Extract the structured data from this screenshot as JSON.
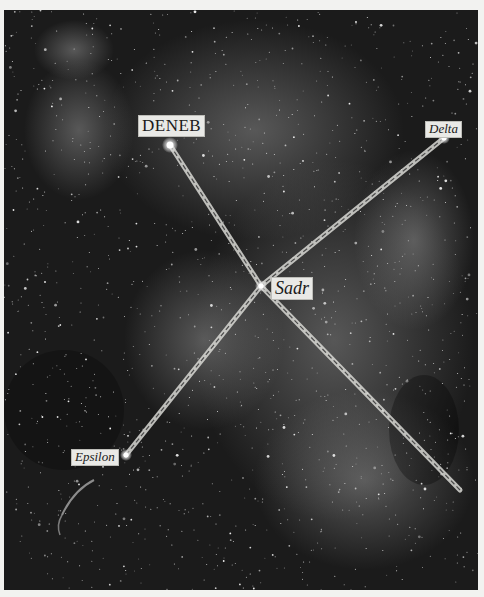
{
  "photo": {
    "subject": "Star field with asterism overlay (Northern Cross)",
    "colors": {
      "background": "#1b1b1b",
      "page": "#f2f2f0",
      "line": "#d8d8d4",
      "line_dash": "#4a4a4a",
      "label_bg": "#e9e9e6",
      "label_text": "#1a1a1a"
    }
  },
  "stars": [
    {
      "id": "deneb",
      "label": "DENEB",
      "x": 166,
      "y": 135,
      "style": "caps"
    },
    {
      "id": "delta",
      "label": "Delta",
      "x": 440,
      "y": 128,
      "style": "italic"
    },
    {
      "id": "sadr",
      "label": "Sadr",
      "x": 257,
      "y": 276,
      "style": "italic"
    },
    {
      "id": "epsilon",
      "label": "Epsilon",
      "x": 122,
      "y": 445,
      "style": "italic"
    }
  ],
  "lines": [
    {
      "from": [
        166,
        135
      ],
      "to": [
        257,
        276
      ]
    },
    {
      "from": [
        440,
        128
      ],
      "to": [
        257,
        276
      ]
    },
    {
      "from": [
        122,
        445
      ],
      "to": [
        257,
        276
      ]
    },
    {
      "from": [
        257,
        276
      ],
      "to": [
        456,
        480
      ]
    }
  ],
  "labels": {
    "deneb": "DENEB",
    "delta": "Delta",
    "sadr": "Sadr",
    "epsilon": "Epsilon"
  }
}
